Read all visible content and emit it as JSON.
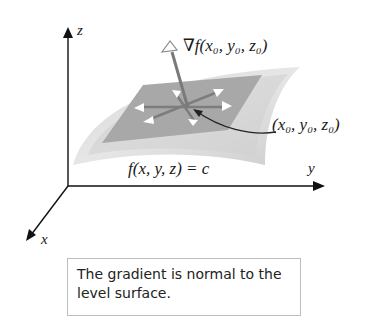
{
  "figure": {
    "axes": {
      "x_label": "x",
      "y_label": "y",
      "z_label": "z"
    },
    "gradient_label": "∇f(x₀, y₀, z₀)",
    "point_label": "(x₀, y₀, z₀)",
    "surface_label": "f(x, y, z) = c",
    "colors": {
      "surface_outer": "#e3e3e3",
      "surface_inner": "#cfcfcf",
      "tangent_plane": "#a9a9a9",
      "vectors": "#7a7a7a",
      "axes": "#111111"
    }
  },
  "caption": {
    "text": "The gradient is normal to the level surface."
  }
}
